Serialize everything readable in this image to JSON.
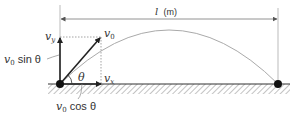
{
  "diagram": {
    "type": "projectile-motion",
    "labels": {
      "distance": "l (m)",
      "distance_var": "l",
      "distance_unit": "(m)",
      "v0": "v",
      "v0_sub": "0",
      "vy": "v",
      "vy_sub": "y",
      "vx": "v",
      "vx_sub": "x",
      "theta": "θ",
      "v0_sin_prefix": "v",
      "v0_sin_sub": "0",
      "v0_sin_text": " sin θ",
      "v0_cos_prefix": "v",
      "v0_cos_sub": "0",
      "v0_cos_text": " cos θ"
    },
    "colors": {
      "stroke": "#333333",
      "trajectory": "#aaaaaa",
      "guide": "#999999",
      "hatch": "#888888",
      "point": "#111111"
    },
    "points": {
      "launch": {
        "x": 60,
        "y": 84
      },
      "landing": {
        "x": 278,
        "y": 84
      }
    }
  }
}
